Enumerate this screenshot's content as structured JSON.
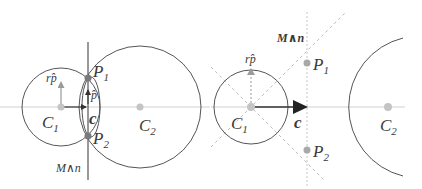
{
  "colors": {
    "background": "#ffffff",
    "stroke": "#555555",
    "axis": "#c8c8c8",
    "dashed": "#b0b0b0",
    "point_center": "#c0c0c0",
    "point_intersection": "#7a7a7a",
    "point_intersection_light": "#a8a8a8",
    "arrow": "#333333",
    "text": "#3a3a3a"
  },
  "left_panel": {
    "labels": {
      "c1": "C",
      "c1_sub": "1",
      "c2": "C",
      "c2_sub": "2",
      "p1": "P",
      "p1_sub": "1",
      "p2": "P",
      "p2_sub": "2",
      "c": "c",
      "rp": "rp̂",
      "p_hat": "p̂",
      "plane": "M∧n"
    }
  },
  "right_panel": {
    "labels": {
      "c1": "C",
      "c1_sub": "1",
      "c2": "C",
      "c2_sub": "2",
      "p1": "P",
      "p1_sub": "1",
      "p2": "P",
      "p2_sub": "2",
      "c": "c",
      "rp": "rp̂",
      "plane": "M∧n"
    }
  }
}
